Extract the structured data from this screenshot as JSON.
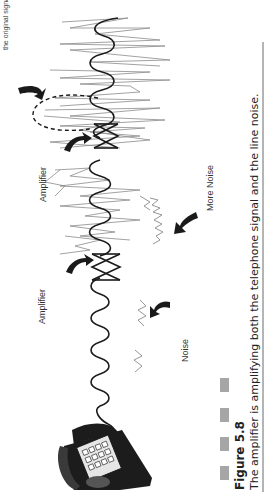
{
  "figure": {
    "number_label": "Figure 5.8",
    "caption": "The amplifier is amplifying both the telephone signal and the line noise.",
    "top_note": "the original signal.",
    "labels": {
      "amplifier_1": "Amplifier",
      "amplifier_2": "Amplifier",
      "noise": "Noise",
      "more_noise": "More Noise"
    },
    "colors": {
      "signal": "#1a1a1a",
      "noise": "#8a8a8a",
      "caption_bars": "#a6a6a6",
      "phone_body": "#1c1c1c",
      "keypad": "#e6e6e6"
    }
  }
}
